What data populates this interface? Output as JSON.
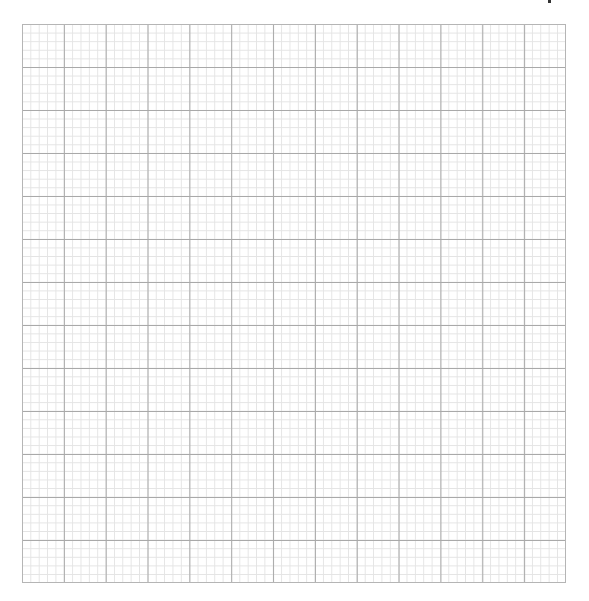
{
  "page": {
    "type": "graph-paper",
    "grid": {
      "major_columns": 13,
      "major_rows": 13,
      "minor_per_major": 5,
      "major_line_color": "#a9a9a9",
      "minor_line_color": "#e4e4e4",
      "border_color": "#b5b5b5"
    },
    "label": ""
  }
}
